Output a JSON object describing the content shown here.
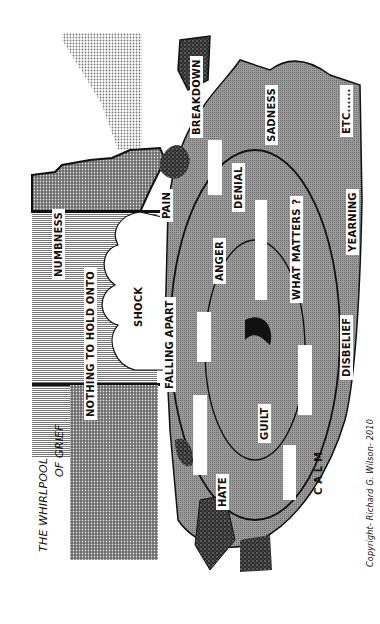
{
  "title": {
    "line1": "THE WHIRLPOOL",
    "line2": "OF GRIEF"
  },
  "labels": {
    "numbness": "NUMBNESS",
    "nothing_to_hold_onto": "NOTHING TO HOLD ONTO",
    "shock": "SHOCK",
    "pain": "PAIN",
    "breakdown": "BREAKDOWN",
    "falling_apart": "FALLING APART",
    "anger": "ANGER",
    "denial": "DENIAL",
    "sadness": "SADNESS",
    "what_matters": "WHAT MATTERS ?",
    "etc": "ETC......",
    "yearning": "YEARNING",
    "guilt": "GUILT",
    "hate": "HATE",
    "calm": "C A L M",
    "disbelief": "DISBELIEF"
  },
  "copyright": "Copyright- Richard G. Wilson- 2010",
  "colors": {
    "whirl_grey": "#8a8a8a",
    "dark_rock": "#3a3a3a",
    "dot_grey": "#b5b5b5",
    "stripe_grey": "#9a9a9a",
    "ink": "#111111"
  }
}
